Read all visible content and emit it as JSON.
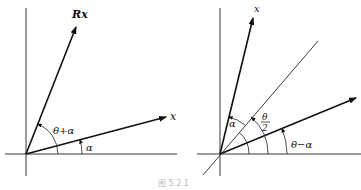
{
  "figure": {
    "left_panel": {
      "labels": {
        "rotated_vector": "Rx",
        "vector": "x",
        "angle_sum": "θ+α",
        "angle_alpha": "α"
      }
    },
    "right_panel": {
      "labels": {
        "vector": "x",
        "half_angle_num": "θ",
        "half_angle_den": "2",
        "angle_diff": "θ−α",
        "angle_alpha": "α"
      }
    },
    "caption": "图 5.2.1"
  }
}
